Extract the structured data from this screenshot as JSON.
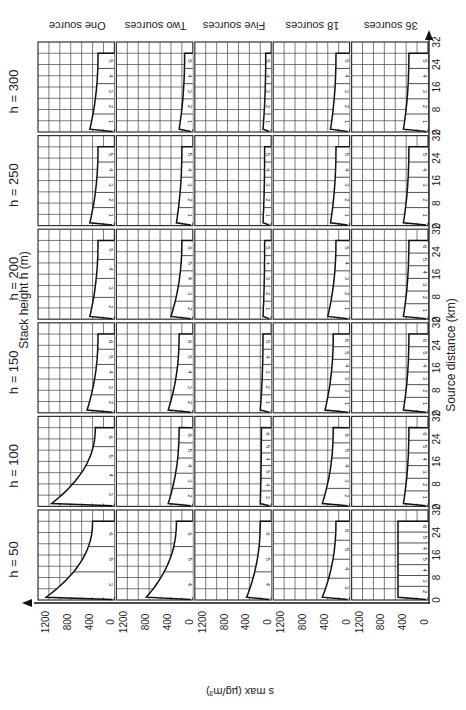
{
  "chart_data": {
    "type": "line",
    "orientation_note": "figure printed rotated 90 degrees counter-clockwise; grid of small multiples",
    "xlabel": "Source distance (km)",
    "ylabel": "s max (µg/m³)",
    "row_axis_label": "Stack height h (m)",
    "x_ticks": [
      "0",
      "8",
      "16",
      "24",
      "32"
    ],
    "y_ticks": [
      "0",
      "400",
      "800",
      "1200"
    ],
    "xlim": [
      0,
      32
    ],
    "ylim": [
      0,
      1400
    ],
    "grid": true,
    "stack_heights": [
      "h = 50",
      "h = 100",
      "h = 150",
      "h = 200",
      "h = 250",
      "h = 300"
    ],
    "source_groups": [
      "One source",
      "Two sources",
      "Five sources",
      "18 sources",
      "36 sources"
    ],
    "panels": [
      {
        "h": 50,
        "sources": "One source",
        "peak": 1250,
        "tail": 400,
        "zones": [
          "3",
          "5",
          "6"
        ]
      },
      {
        "h": 50,
        "sources": "Two sources",
        "peak": 850,
        "tail": 300,
        "zones": [
          "4",
          "5",
          "6"
        ]
      },
      {
        "h": 50,
        "sources": "Five sources",
        "peak": 450,
        "tail": 200,
        "zones": [
          "4",
          "5",
          "6"
        ]
      },
      {
        "h": 50,
        "sources": "18 sources",
        "peak": 500,
        "tail": 250,
        "zones": [
          "3",
          "4",
          "5",
          "6"
        ]
      },
      {
        "h": 50,
        "sources": "36 sources",
        "peak": 550,
        "tail": 550,
        "zones": [
          "2",
          "3",
          "4",
          "5",
          "4",
          "5",
          "6"
        ]
      },
      {
        "h": 100,
        "sources": "One source",
        "peak": 1150,
        "tail": 350,
        "zones": [
          "3",
          "4",
          "5",
          "6"
        ]
      },
      {
        "h": 100,
        "sources": "Two sources",
        "peak": 450,
        "tail": 250,
        "zones": [
          "2",
          "3",
          "4",
          "5",
          "6"
        ]
      },
      {
        "h": 100,
        "sources": "Five sources",
        "peak": 200,
        "tail": 180,
        "zones": [
          "3",
          "4",
          "5",
          "4",
          "5",
          "6"
        ]
      },
      {
        "h": 100,
        "sources": "18 sources",
        "peak": 500,
        "tail": 300,
        "zones": [
          "2",
          "3",
          "4",
          "5",
          "6"
        ]
      },
      {
        "h": 100,
        "sources": "36 sources",
        "peak": 450,
        "tail": 350,
        "zones": [
          "1",
          "2",
          "3",
          "4",
          "5",
          "6"
        ]
      },
      {
        "h": 150,
        "sources": "One source",
        "peak": 500,
        "tail": 300,
        "zones": [
          "2",
          "3",
          "4",
          "5",
          "6"
        ]
      },
      {
        "h": 150,
        "sources": "Two sources",
        "peak": 450,
        "tail": 250,
        "zones": [
          "2",
          "3",
          "4",
          "5",
          "6"
        ]
      },
      {
        "h": 150,
        "sources": "Five sources",
        "peak": 200,
        "tail": 150,
        "zones": [
          "1",
          "2",
          "3",
          "4",
          "5"
        ]
      },
      {
        "h": 150,
        "sources": "18 sources",
        "peak": 450,
        "tail": 300,
        "zones": [
          "1",
          "2",
          "3",
          "4",
          "5",
          "6"
        ]
      },
      {
        "h": 150,
        "sources": "36 sources",
        "peak": 450,
        "tail": 350,
        "zones": [
          "1",
          "2",
          "3",
          "4",
          "5",
          "6"
        ]
      },
      {
        "h": 200,
        "sources": "One source",
        "peak": 450,
        "tail": 300,
        "zones": [
          "2",
          "3",
          "4",
          "5"
        ]
      },
      {
        "h": 200,
        "sources": "Two sources",
        "peak": 400,
        "tail": 200,
        "zones": [
          "2",
          "3",
          "4",
          "5",
          "6"
        ]
      },
      {
        "h": 200,
        "sources": "Five sources",
        "peak": 150,
        "tail": 120,
        "zones": [
          "1",
          "2",
          "3",
          "4",
          "5"
        ]
      },
      {
        "h": 200,
        "sources": "18 sources",
        "peak": 400,
        "tail": 250,
        "zones": [
          "1",
          "2",
          "3",
          "4",
          "5"
        ]
      },
      {
        "h": 200,
        "sources": "36 sources",
        "peak": 450,
        "tail": 350,
        "zones": [
          "1",
          "2",
          "3",
          "4",
          "5",
          "6"
        ]
      },
      {
        "h": 250,
        "sources": "One source",
        "peak": 450,
        "tail": 300,
        "zones": [
          "1",
          "2",
          "3",
          "4",
          "5"
        ]
      },
      {
        "h": 250,
        "sources": "Two sources",
        "peak": 300,
        "tail": 200,
        "zones": [
          "1",
          "2",
          "3",
          "4",
          "5"
        ]
      },
      {
        "h": 250,
        "sources": "Five sources",
        "peak": 150,
        "tail": 120,
        "zones": [
          "1",
          "2",
          "3",
          "4",
          "5"
        ]
      },
      {
        "h": 250,
        "sources": "18 sources",
        "peak": 350,
        "tail": 250,
        "zones": [
          "1",
          "2",
          "3",
          "4",
          "5"
        ]
      },
      {
        "h": 250,
        "sources": "36 sources",
        "peak": 450,
        "tail": 350,
        "zones": [
          "1",
          "2",
          "3",
          "4",
          "5"
        ]
      },
      {
        "h": 300,
        "sources": "One source",
        "peak": 450,
        "tail": 300,
        "zones": [
          "1",
          "2",
          "3",
          "4",
          "5"
        ]
      },
      {
        "h": 300,
        "sources": "Two sources",
        "peak": 250,
        "tail": 150,
        "zones": [
          "1",
          "2",
          "3",
          "4",
          "5"
        ]
      },
      {
        "h": 300,
        "sources": "Five sources",
        "peak": 150,
        "tail": 100,
        "zones": [
          "1",
          "2",
          "3",
          "4",
          "5"
        ]
      },
      {
        "h": 300,
        "sources": "18 sources",
        "peak": 350,
        "tail": 250,
        "zones": [
          "1",
          "2",
          "3",
          "4",
          "5"
        ]
      },
      {
        "h": 300,
        "sources": "36 sources",
        "peak": 450,
        "tail": 350,
        "zones": [
          "1",
          "2",
          "3",
          "4",
          "5"
        ]
      }
    ]
  },
  "labels": {
    "row_axis_title": "Stack height h (m)",
    "x_axis_title": "Source distance (km)",
    "y_axis_title": "s max (µg/m³)"
  }
}
